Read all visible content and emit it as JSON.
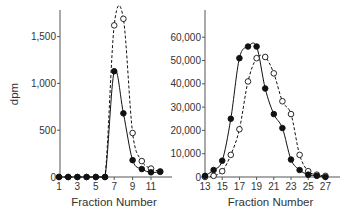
{
  "figure": {
    "ylabel": "dpm",
    "colors": {
      "axis": "#555555",
      "filled": "#111111",
      "open_fill": "#ffffff",
      "text": "#333333"
    }
  },
  "chart_data": [
    {
      "type": "line",
      "panel": "left",
      "xlabel": "Fraction Number",
      "ylabel": "dpm",
      "xlim": [
        1,
        12
      ],
      "ylim": [
        0,
        1800
      ],
      "xticks": [
        1,
        3,
        5,
        7,
        9,
        11
      ],
      "xtick_labels": [
        "1",
        "3",
        "5",
        "7",
        "9",
        "11"
      ],
      "yticks": [
        0,
        500,
        1000,
        1500
      ],
      "ytick_labels": [
        "0",
        "500",
        "1,000",
        "1,500"
      ],
      "grid": false,
      "legend": null,
      "x": [
        1,
        2,
        3,
        4,
        5,
        6,
        7,
        8,
        9,
        10,
        11,
        12
      ],
      "series": [
        {
          "name": "filled circles (solid line)",
          "marker": "filled",
          "line": "solid",
          "values": [
            0,
            0,
            0,
            0,
            0,
            0,
            1130,
            680,
            180,
            85,
            50,
            55
          ]
        },
        {
          "name": "open circles (dashed line)",
          "marker": "open",
          "line": "dashed",
          "values": [
            0,
            0,
            0,
            0,
            0,
            0,
            1620,
            1690,
            470,
            170,
            90,
            60
          ]
        }
      ]
    },
    {
      "type": "line",
      "panel": "right",
      "xlabel": "Fraction Number",
      "ylabel": "",
      "xlim": [
        13,
        27
      ],
      "ylim": [
        0,
        70000
      ],
      "xticks": [
        13,
        15,
        17,
        19,
        21,
        23,
        25,
        27
      ],
      "xtick_labels": [
        "13",
        "15",
        "17",
        "19",
        "21",
        "23",
        "25",
        "27"
      ],
      "yticks": [
        0,
        10000,
        20000,
        30000,
        40000,
        50000,
        60000
      ],
      "ytick_labels": [
        "0",
        "10,000",
        "20,000",
        "30,000",
        "40,000",
        "50,000",
        "60,000"
      ],
      "grid": false,
      "legend": null,
      "x": [
        13,
        14,
        15,
        16,
        17,
        18,
        19,
        20,
        21,
        22,
        23,
        24,
        25,
        26,
        27
      ],
      "series": [
        {
          "name": "filled circles (solid line)",
          "marker": "filled",
          "line": "solid",
          "values": [
            500,
            3000,
            7000,
            25000,
            51000,
            56000,
            56000,
            38000,
            27000,
            21000,
            7500,
            3000,
            1000,
            500,
            0
          ]
        },
        {
          "name": "open circles (dashed line)",
          "marker": "open",
          "line": "dashed",
          "values": [
            0,
            500,
            2500,
            9500,
            20500,
            41000,
            51000,
            51500,
            44500,
            32500,
            27000,
            9500,
            2500,
            1000,
            500
          ]
        }
      ]
    }
  ]
}
